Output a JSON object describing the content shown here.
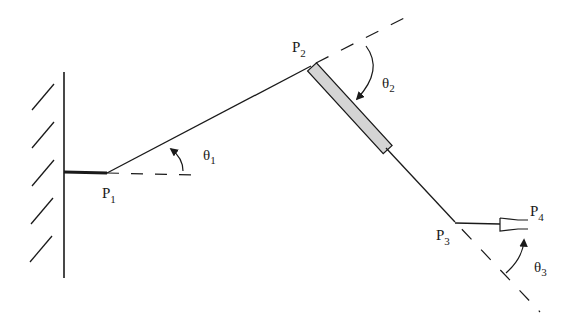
{
  "diagram": {
    "points": {
      "p1": {
        "label": "P",
        "sub": "1"
      },
      "p2": {
        "label": "P",
        "sub": "2"
      },
      "p3": {
        "label": "P",
        "sub": "3"
      },
      "p4": {
        "label": "P",
        "sub": "4"
      }
    },
    "angles": {
      "theta1": {
        "label": "θ",
        "sub": "1"
      },
      "theta2": {
        "label": "θ",
        "sub": "2"
      },
      "theta3": {
        "label": "θ",
        "sub": "3"
      }
    },
    "colors": {
      "line": "#1a1a1a",
      "prismatic_fill": "#d4d4d4"
    }
  }
}
